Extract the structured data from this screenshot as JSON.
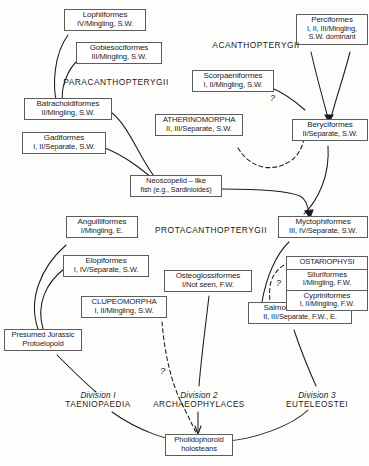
{
  "diagram": {
    "title_implicit": "Teleost phylogeny / divisions chart",
    "nodes": [
      {
        "id": "lophiiformes",
        "l1": "Lophiiformes",
        "l2": "IV/Mingling, S.W.",
        "l3": ""
      },
      {
        "id": "gobiesociformes",
        "l1": "Gobiesociformes",
        "l2": "III/Mingling, S.W.",
        "l3": ""
      },
      {
        "id": "batrachoidiformes",
        "l1": "Batrachoidiformes",
        "l2": "II/Mingling, S.W.",
        "l3": ""
      },
      {
        "id": "gadiformes",
        "l1": "Gadiformes",
        "l2": "I, II/Separate, S.W.",
        "l3": ""
      },
      {
        "id": "atherinomorpha",
        "l1": "ATHERINOMORPHA",
        "l2": "II, III/Separate, S.W.",
        "l3": ""
      },
      {
        "id": "perciformes",
        "l1": "Perciformes",
        "l2": "I, II, III/Mingling,",
        "l3": "S.W. dominant"
      },
      {
        "id": "scorpaeniformes",
        "l1": "Scorpaeniformes",
        "l2": "I, II/Mingling, S.W.",
        "l3": ""
      },
      {
        "id": "beryciformes",
        "l1": "Beryciformes",
        "l2": "II/Separate, S.W.",
        "l3": ""
      },
      {
        "id": "neoscopelid",
        "l1": "Neoscopelid – like",
        "l2": "fish  (e.g., Sardinioides)",
        "l3": ""
      },
      {
        "id": "myctophiformes",
        "l1": "Myctophiformes",
        "l2": "III, IV/Separate, S.W.",
        "l3": ""
      },
      {
        "id": "anguilliformes",
        "l1": "Anguilliformes",
        "l2": "I/Mingling, E.",
        "l3": ""
      },
      {
        "id": "elopiformes",
        "l1": "Elopiformes",
        "l2": "I, IV/Separate, S.W.",
        "l3": ""
      },
      {
        "id": "clupeomorpha",
        "l1": "CLUPEOMORPHA",
        "l2": "I, II/Mingling, S.W.",
        "l3": ""
      },
      {
        "id": "osteoglossiformes",
        "l1": "Osteoglossiformes",
        "l2": "I/Not seen, F.W.",
        "l3": ""
      },
      {
        "id": "salmoniformes",
        "l1": "Salmoniformes basal",
        "l2": "II, III/Separate, F.W., E.",
        "l3": ""
      },
      {
        "id": "protoelopoid",
        "l1": "Presumed  Jurassic",
        "l2": "Protoelopoid",
        "l3": ""
      },
      {
        "id": "pholidophoroid",
        "l1": "Pholidophoroid",
        "l2": "holosteans",
        "l3": ""
      }
    ],
    "stacked_nodes": [
      {
        "id": "ostariophysi",
        "segments": [
          {
            "l1": "OSTARIOPHYSI",
            "l2": ""
          },
          {
            "l1": "Siluriformes",
            "l2": "I/Mingling, F.W."
          },
          {
            "l1": "Cypriniformes",
            "l2": "I, II/Mingling, F.W."
          }
        ]
      }
    ],
    "free_labels": [
      {
        "id": "paracanthopterygii",
        "caps": "PARACANTHOPTERYGII",
        "italic": ""
      },
      {
        "id": "acanthopterygii",
        "caps": "ACANTHOPTERYGII",
        "italic": ""
      },
      {
        "id": "protacanthopterygii",
        "caps": "PROTACANTHOPTERYGII",
        "italic": ""
      },
      {
        "id": "division1",
        "caps": "TAENIOPAEDIA",
        "italic": "Division  I"
      },
      {
        "id": "division2",
        "caps": "ARCHAEOPHYLACES",
        "italic": "Division  2"
      },
      {
        "id": "division3",
        "caps": "EUTELEOSTEI",
        "italic": "Division 3"
      }
    ],
    "uncertainty_marks": [
      {
        "id": "q-beryciformes",
        "text": "?"
      },
      {
        "id": "q-ostariophysi",
        "text": "?"
      },
      {
        "id": "q-clupeomorpha",
        "text": "?"
      }
    ],
    "colors": {
      "background": "#fdfdfc",
      "box_border": "#5c5c5c",
      "line": "#1b1b1b",
      "text": "#1b1b1b"
    }
  }
}
